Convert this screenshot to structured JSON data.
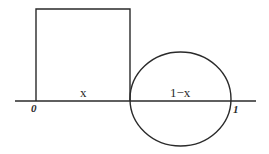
{
  "diagram": {
    "labels": {
      "origin": "0",
      "end": "1",
      "left_segment": "x",
      "right_segment": "1−x"
    },
    "shapes": {
      "baseline": {
        "x1": 15,
        "y1": 101,
        "x2": 256,
        "y2": 101
      },
      "square": {
        "x": 36,
        "y": 9,
        "width": 94,
        "height": 92,
        "side_label": "x"
      },
      "circle": {
        "cx": 180.5,
        "cy": 99,
        "rx": 50.5,
        "ry": 47,
        "diameter_label": "1−x"
      }
    },
    "colors": {
      "stroke": "#2a2a2a",
      "background": "#ffffff"
    }
  }
}
